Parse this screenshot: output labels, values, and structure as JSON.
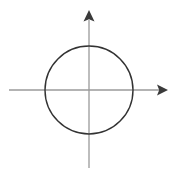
{
  "figure": {
    "name": "circle-centered-at-origin-on-coordinate-axes",
    "background_color": "#ffffff",
    "width": 176,
    "height": 175
  },
  "chart_data": {
    "type": "scatter",
    "title": "",
    "subtitle": "",
    "xlabel": "",
    "ylabel": "",
    "grid": false,
    "legend": null,
    "annotations": [],
    "tick_labels": {
      "x": [],
      "y": []
    },
    "origin": {
      "x": 89,
      "y": 90
    },
    "shapes": [
      {
        "name": "circle",
        "type": "circle",
        "center_x": 89,
        "center_y": 90,
        "radius": 44,
        "stroke": "#333333",
        "stroke_width": 1.4,
        "fill": "none"
      }
    ],
    "axes": [
      {
        "name": "x-axis",
        "orientation": "horizontal",
        "x1": 9,
        "y1": 90,
        "x2": 160,
        "y2": 90,
        "stroke": "#9a9a9a",
        "stroke_width": 1.3,
        "arrow": "end"
      },
      {
        "name": "y-axis",
        "orientation": "vertical",
        "x1": 89,
        "y1": 168,
        "x2": 89,
        "y2": 20,
        "stroke": "#9a9a9a",
        "stroke_width": 1.3,
        "arrow": "end"
      }
    ],
    "arrowheads": [
      {
        "name": "x-axis-arrowhead",
        "direction": "right",
        "tip_x": 168,
        "tip_y": 90,
        "points": "168,90 157,85 159,90 157,95",
        "fill": "#3a3a3a"
      },
      {
        "name": "y-axis-arrowhead",
        "direction": "up",
        "tip_x": 89,
        "tip_y": 10,
        "points": "89,10 84,21 89,19 94,21",
        "fill": "#3a3a3a"
      }
    ],
    "colors": {
      "circle_stroke": "#333333",
      "axis_stroke": "#9a9a9a",
      "arrowhead_fill": "#3a3a3a",
      "background": "#ffffff"
    }
  }
}
